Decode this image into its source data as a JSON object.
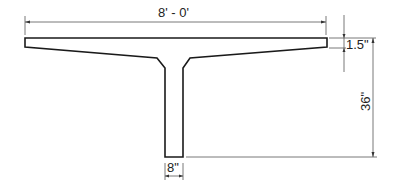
{
  "drawing": {
    "title": "T-beam cross-section",
    "dimensions": {
      "overall_width": "8' - 0'",
      "flange_thickness": "1.5\"",
      "overall_depth": "36\"",
      "web_width": "8\""
    },
    "colors": {
      "outline": "#1a1a1a",
      "dimension_line": "#555555",
      "background": "#ffffff"
    }
  }
}
